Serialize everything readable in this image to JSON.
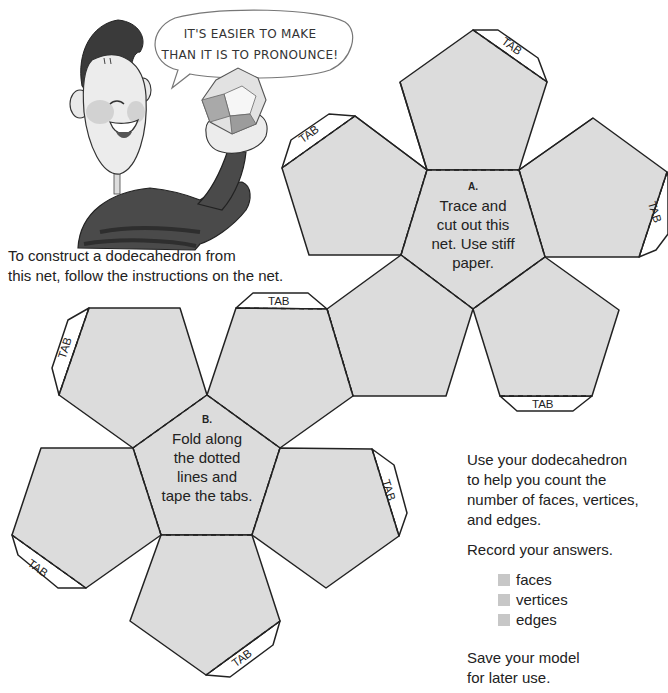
{
  "speech_bubble": {
    "line1": "It's easier to make",
    "line2": "than it is to pronounce!"
  },
  "intro": {
    "line1": "To construct a dodecahedron from",
    "line2": "this net, follow the instructions on the net."
  },
  "net_a": {
    "letter": "A.",
    "line1": "Trace and",
    "line2": "cut out this",
    "line3": "net. Use stiff",
    "line4": "paper."
  },
  "net_b": {
    "letter": "B.",
    "line1": "Fold along",
    "line2": "the dotted",
    "line3": "lines and",
    "line4": "tape the tabs."
  },
  "tab_label": "TAB",
  "sidebar": {
    "instruction": {
      "line1": "Use your dodecahedron",
      "line2": "to help you count the",
      "line3": "number of faces, vertices,",
      "line4": "and edges."
    },
    "record": "Record your answers.",
    "answers": [
      {
        "label": "faces"
      },
      {
        "label": "vertices"
      },
      {
        "label": "edges"
      }
    ],
    "save": {
      "line1": "Save your model",
      "line2": "for later use."
    }
  },
  "colors": {
    "face_fill": "#dcdcdc",
    "outline": "#222222",
    "answer_box": "#c7c7c7"
  }
}
